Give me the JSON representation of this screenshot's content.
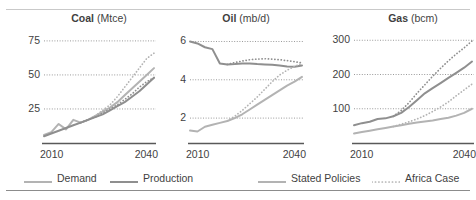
{
  "figure": {
    "background": "#ffffff",
    "text_color": "#3f3f3f",
    "top_rule_color": "#c9c9c9",
    "bottom_rule_color": "#8c8c8c"
  },
  "colors": {
    "demand": "#b3b3b3",
    "production": "#8f8f8f",
    "gridline": "#9a9a9a",
    "axis": "#595959"
  },
  "legend": {
    "items": [
      {
        "label": "Demand",
        "color": "#b3b3b3",
        "style": "solid",
        "swatch": "line-swatch-solid"
      },
      {
        "label": "Production",
        "color": "#8f8f8f",
        "style": "solid",
        "swatch": "line-swatch-solid"
      },
      {
        "label": "Stated Policies",
        "color": "#b3b3b3",
        "style": "solid",
        "swatch": "line-swatch-solid"
      },
      {
        "label": "Africa Case",
        "color": "#b3b3b3",
        "style": "dotted",
        "swatch": "line-swatch-dotted"
      }
    ]
  },
  "chart_data": [
    {
      "type": "line",
      "title": "Coal (Mtce)",
      "title_name": "Coal",
      "title_unit": "(Mtce)",
      "xlabel": "",
      "ylabel": "Mtce",
      "xlim": [
        2010,
        2040
      ],
      "ylim": [
        0,
        83
      ],
      "xticks": [
        2010,
        2040
      ],
      "xticklabels": [
        "2010",
        "2040"
      ],
      "yticks": [
        25,
        50,
        75
      ],
      "yticklabels": [
        "25",
        "50",
        "75"
      ],
      "grid": true,
      "x": [
        2010,
        2012,
        2014,
        2016,
        2018,
        2020,
        2022,
        2024,
        2026,
        2028,
        2030,
        2032,
        2034,
        2036,
        2038,
        2040
      ],
      "series": [
        {
          "name": "Demand Stated Policies",
          "variable": "Demand",
          "scenario": "Stated Policies",
          "style": "solid",
          "color": "#b3b3b3",
          "values": [
            6,
            8,
            14,
            10,
            17,
            15,
            17,
            20,
            23,
            26,
            30,
            35,
            40,
            45,
            50,
            55
          ]
        },
        {
          "name": "Demand Africa Case",
          "variable": "Demand",
          "scenario": "Africa Case",
          "style": "dotted",
          "color": "#b3b3b3",
          "values": [
            null,
            null,
            null,
            null,
            null,
            15,
            17,
            20,
            24,
            28,
            34,
            41,
            48,
            55,
            62,
            66
          ]
        },
        {
          "name": "Production Stated Policies",
          "variable": "Production",
          "scenario": "Stated Policies",
          "style": "solid",
          "color": "#8f8f8f",
          "values": [
            5,
            7,
            9,
            11,
            13,
            15,
            17,
            19,
            21,
            24,
            27,
            30,
            34,
            38,
            43,
            48
          ]
        },
        {
          "name": "Production Africa Case",
          "variable": "Production",
          "scenario": "Africa Case",
          "style": "dotted",
          "color": "#8f8f8f",
          "values": [
            null,
            null,
            null,
            null,
            null,
            15,
            17,
            19,
            22,
            25,
            28,
            32,
            36,
            41,
            45,
            48
          ]
        }
      ]
    },
    {
      "type": "line",
      "title": "Oil (mb/d)",
      "title_name": "Oil",
      "title_unit": "(mb/d)",
      "xlabel": "",
      "ylabel": "mb/d",
      "xlim": [
        2010,
        2040
      ],
      "ylim": [
        0.7,
        6.6
      ],
      "xticks": [
        2010,
        2040
      ],
      "xticklabels": [
        "2010",
        "2040"
      ],
      "yticks": [
        2,
        4,
        6
      ],
      "yticklabels": [
        "2",
        "4",
        "6"
      ],
      "grid": true,
      "x": [
        2010,
        2012,
        2014,
        2016,
        2018,
        2020,
        2022,
        2024,
        2026,
        2028,
        2030,
        2032,
        2034,
        2036,
        2038,
        2040
      ],
      "series": [
        {
          "name": "Production Stated Policies",
          "variable": "Production",
          "scenario": "Stated Policies",
          "style": "solid",
          "color": "#8f8f8f",
          "values": [
            6.0,
            5.9,
            5.7,
            5.6,
            4.85,
            4.8,
            4.82,
            4.85,
            4.85,
            4.82,
            4.8,
            4.78,
            4.75,
            4.7,
            4.68,
            4.75
          ]
        },
        {
          "name": "Production Africa Case",
          "variable": "Production",
          "scenario": "Africa Case",
          "style": "dotted",
          "color": "#8f8f8f",
          "values": [
            null,
            null,
            null,
            null,
            null,
            4.8,
            4.9,
            4.98,
            5.05,
            5.08,
            5.1,
            5.08,
            5.05,
            5.0,
            4.95,
            4.88
          ]
        },
        {
          "name": "Demand Stated Policies",
          "variable": "Demand",
          "scenario": "Stated Policies",
          "style": "solid",
          "color": "#b3b3b3",
          "values": [
            1.35,
            1.3,
            1.55,
            1.65,
            1.75,
            1.85,
            2.0,
            2.2,
            2.45,
            2.7,
            2.95,
            3.2,
            3.45,
            3.7,
            3.9,
            4.15
          ]
        },
        {
          "name": "Demand Africa Case",
          "variable": "Demand",
          "scenario": "Africa Case",
          "style": "dotted",
          "color": "#b3b3b3",
          "values": [
            null,
            null,
            null,
            null,
            null,
            1.85,
            2.1,
            2.4,
            2.75,
            3.1,
            3.5,
            3.9,
            4.25,
            4.5,
            4.7,
            4.85
          ]
        }
      ]
    },
    {
      "type": "line",
      "title": "Gas (bcm)",
      "title_name": "Gas",
      "title_unit": "(bcm)",
      "xlabel": "",
      "ylabel": "bcm",
      "xlim": [
        2010,
        2040
      ],
      "ylim": [
        0,
        330
      ],
      "xticks": [
        2010,
        2040
      ],
      "xticklabels": [
        "2010",
        "2040"
      ],
      "yticks": [
        100,
        200,
        300
      ],
      "yticklabels": [
        "100",
        "200",
        "300"
      ],
      "grid": true,
      "x": [
        2010,
        2012,
        2014,
        2016,
        2018,
        2020,
        2022,
        2024,
        2026,
        2028,
        2030,
        2032,
        2034,
        2036,
        2038,
        2040
      ],
      "series": [
        {
          "name": "Production Stated Policies",
          "variable": "Production",
          "scenario": "Stated Policies",
          "style": "solid",
          "color": "#8f8f8f",
          "values": [
            52,
            58,
            62,
            70,
            72,
            78,
            88,
            105,
            125,
            145,
            160,
            175,
            190,
            205,
            220,
            238
          ]
        },
        {
          "name": "Production Africa Case",
          "variable": "Production",
          "scenario": "Africa Case",
          "style": "dotted",
          "color": "#8f8f8f",
          "values": [
            null,
            null,
            null,
            null,
            null,
            78,
            95,
            118,
            145,
            170,
            195,
            218,
            240,
            260,
            278,
            298
          ]
        },
        {
          "name": "Demand Stated Policies",
          "variable": "Demand",
          "scenario": "Stated Policies",
          "style": "solid",
          "color": "#b3b3b3",
          "values": [
            28,
            32,
            36,
            40,
            44,
            48,
            52,
            56,
            60,
            63,
            66,
            70,
            74,
            80,
            88,
            100
          ]
        },
        {
          "name": "Demand Africa Case",
          "variable": "Demand",
          "scenario": "Africa Case",
          "style": "dotted",
          "color": "#b3b3b3",
          "values": [
            null,
            null,
            null,
            null,
            null,
            48,
            55,
            62,
            70,
            80,
            92,
            105,
            120,
            138,
            155,
            172
          ]
        }
      ]
    }
  ]
}
